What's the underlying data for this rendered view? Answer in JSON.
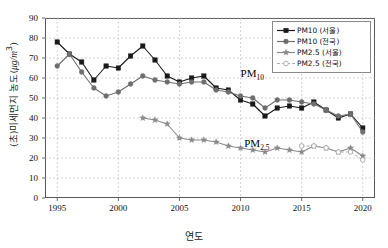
{
  "chart_data": {
    "type": "line",
    "title": "",
    "xlabel": "연도",
    "ylabel": "(초)미세먼지 농도( μg/m³)",
    "ylabel_main": "(초)미세먼지 농도(",
    "ylabel_unit": "μg/m",
    "ylabel_unit_sup": "3",
    "ylabel_close": ")",
    "xlim": [
      1994,
      2021
    ],
    "ylim": [
      0,
      90
    ],
    "yticks": [
      0,
      10,
      20,
      30,
      40,
      50,
      60,
      70,
      80,
      90
    ],
    "xticks": [
      1995,
      2000,
      2005,
      2010,
      2015,
      2020
    ],
    "grid": true,
    "grid_style": "dashed",
    "legend_position": "top-right",
    "x": [
      1995,
      1996,
      1997,
      1998,
      1999,
      2000,
      2001,
      2002,
      2003,
      2004,
      2005,
      2006,
      2007,
      2008,
      2009,
      2010,
      2011,
      2012,
      2013,
      2014,
      2015,
      2016,
      2017,
      2018,
      2019,
      2020
    ],
    "series": [
      {
        "name": "PM10 (서울)",
        "marker": "square",
        "color": "#1a1a1a",
        "linestyle": "solid",
        "x": [
          1995,
          1996,
          1997,
          1998,
          1999,
          2000,
          2001,
          2002,
          2003,
          2004,
          2005,
          2006,
          2007,
          2008,
          2009,
          2010,
          2011,
          2012,
          2013,
          2014,
          2015,
          2016,
          2017,
          2018,
          2019,
          2020
        ],
        "values": [
          78,
          72,
          68,
          59,
          66,
          65,
          71,
          76,
          69,
          61,
          58,
          60,
          61,
          55,
          54,
          49,
          47,
          41,
          45,
          46,
          45,
          48,
          44,
          40,
          42,
          35
        ]
      },
      {
        "name": "PM10 (전국)",
        "marker": "circle",
        "color": "#6e6e6e",
        "linestyle": "solid",
        "x": [
          1995,
          1996,
          1997,
          1998,
          1999,
          2000,
          2001,
          2002,
          2003,
          2004,
          2005,
          2006,
          2007,
          2008,
          2009,
          2010,
          2011,
          2012,
          2013,
          2014,
          2015,
          2016,
          2017,
          2018,
          2019,
          2020
        ],
        "values": [
          66,
          72,
          63,
          55,
          51,
          53,
          57,
          61,
          59,
          58,
          57,
          58,
          58,
          54,
          53,
          51,
          50,
          45,
          49,
          49,
          48,
          47,
          44,
          41,
          42,
          33
        ]
      },
      {
        "name": "PM2.5 (서울)",
        "marker": "star",
        "color": "#8a8a8a",
        "linestyle": "solid",
        "x": [
          2002,
          2003,
          2004,
          2005,
          2006,
          2007,
          2008,
          2009,
          2010,
          2011,
          2012,
          2013,
          2014,
          2015,
          2016,
          2017,
          2018,
          2019,
          2020
        ],
        "values": [
          40,
          39,
          37,
          30,
          29,
          29,
          28,
          26,
          25,
          24,
          23,
          25,
          24,
          23,
          26,
          25,
          23,
          25,
          21
        ]
      },
      {
        "name": "PM2.5 (전국)",
        "marker": "open-circle",
        "color": "#a6a6a6",
        "linestyle": "dashed",
        "x": [
          2015,
          2016,
          2017,
          2018,
          2019,
          2020
        ],
        "values": [
          26,
          26,
          25,
          23,
          23,
          19
        ]
      }
    ],
    "annotations": [
      {
        "text": "PM",
        "sub": "10",
        "x": 2010.0,
        "y": 62
      },
      {
        "text": "PM",
        "sub": "2.5",
        "x": 2010.3,
        "y": 27
      }
    ]
  },
  "legend": {
    "items": [
      {
        "label": "PM10 (서울)"
      },
      {
        "label": "PM10 (전국)"
      },
      {
        "label": "PM2.5 (서울)"
      },
      {
        "label": "PM2.5 (전국)"
      }
    ]
  }
}
